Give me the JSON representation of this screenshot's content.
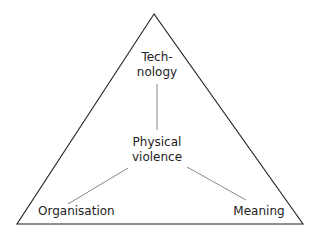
{
  "diagram": {
    "type": "triangle",
    "colors": {
      "outline": "#222222",
      "connector": "#888888",
      "text": "#222222",
      "background": "#ffffff"
    },
    "nodes": {
      "top": {
        "line1": "Tech-",
        "line2": "nology"
      },
      "center": {
        "line1": "Physical",
        "line2": "violence"
      },
      "bottom_left": {
        "label": "Organisation"
      },
      "bottom_right": {
        "label": "Meaning"
      }
    },
    "edges": [
      {
        "from": "center",
        "to": "top"
      },
      {
        "from": "center",
        "to": "bottom_left"
      },
      {
        "from": "center",
        "to": "bottom_right"
      }
    ]
  }
}
